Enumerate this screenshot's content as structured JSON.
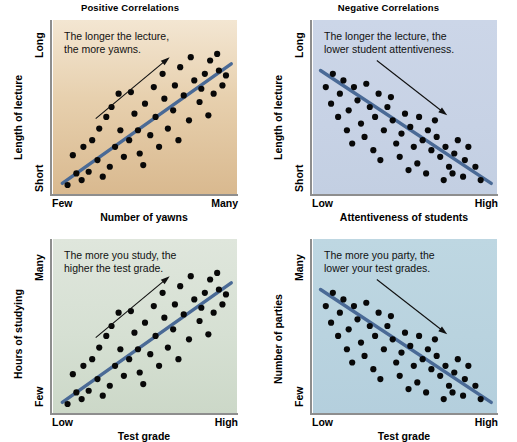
{
  "figure": {
    "width": 517,
    "height": 438,
    "background": "#ffffff"
  },
  "chart_data": [
    {
      "id": "positive-lecture-yawns",
      "type": "scatter",
      "title": "Positive Correlations",
      "caption": "The longer the lecture,\nthe more yawns.",
      "ylabel": "Length of lecture",
      "xlabel": "Number of yawns",
      "ytick_high": "Long",
      "ytick_low": "Short",
      "xtick_low": "Few",
      "xtick_high": "Many",
      "panel_color_top": "#f3e6d2",
      "panel_color_bottom": "#d9b98f",
      "trend_color": "#4a6a96",
      "correlation": "positive",
      "trendline": {
        "x1": 0.03,
        "y1": 0.04,
        "x2": 0.99,
        "y2": 0.76
      },
      "arrow": {
        "x1": 0.22,
        "y1": 0.43,
        "x2": 0.64,
        "y2": 0.8
      },
      "points": [
        [
          0.06,
          0.03
        ],
        [
          0.11,
          0.1
        ],
        [
          0.09,
          0.21
        ],
        [
          0.14,
          0.06
        ],
        [
          0.18,
          0.11
        ],
        [
          0.15,
          0.26
        ],
        [
          0.2,
          0.3
        ],
        [
          0.23,
          0.18
        ],
        [
          0.26,
          0.08
        ],
        [
          0.3,
          0.14
        ],
        [
          0.24,
          0.37
        ],
        [
          0.28,
          0.44
        ],
        [
          0.33,
          0.26
        ],
        [
          0.36,
          0.36
        ],
        [
          0.31,
          0.5
        ],
        [
          0.38,
          0.2
        ],
        [
          0.41,
          0.3
        ],
        [
          0.35,
          0.58
        ],
        [
          0.44,
          0.46
        ],
        [
          0.47,
          0.22
        ],
        [
          0.46,
          0.36
        ],
        [
          0.42,
          0.59
        ],
        [
          0.5,
          0.52
        ],
        [
          0.53,
          0.33
        ],
        [
          0.49,
          0.15
        ],
        [
          0.56,
          0.44
        ],
        [
          0.58,
          0.26
        ],
        [
          0.55,
          0.62
        ],
        [
          0.61,
          0.55
        ],
        [
          0.63,
          0.37
        ],
        [
          0.6,
          0.7
        ],
        [
          0.66,
          0.48
        ],
        [
          0.69,
          0.3
        ],
        [
          0.67,
          0.63
        ],
        [
          0.72,
          0.57
        ],
        [
          0.7,
          0.74
        ],
        [
          0.75,
          0.42
        ],
        [
          0.78,
          0.66
        ],
        [
          0.76,
          0.8
        ],
        [
          0.81,
          0.53
        ],
        [
          0.84,
          0.7
        ],
        [
          0.82,
          0.61
        ],
        [
          0.87,
          0.78
        ],
        [
          0.89,
          0.58
        ],
        [
          0.86,
          0.45
        ],
        [
          0.92,
          0.72
        ],
        [
          0.94,
          0.63
        ],
        [
          0.91,
          0.82
        ],
        [
          0.96,
          0.69
        ]
      ]
    },
    {
      "id": "negative-lecture-attentiveness",
      "type": "scatter",
      "title": "Negative Correlations",
      "caption": "The longer the lecture, the\nlower student attentiveness.",
      "ylabel": "Length of lecture",
      "xlabel": "Attentiveness of students",
      "ytick_high": "Long",
      "ytick_low": "Short",
      "xtick_low": "Low",
      "xtick_high": "High",
      "panel_color_top": "#ccd6e8",
      "panel_color_bottom": "#c3cfe2",
      "trend_color": "#4a6a96",
      "correlation": "negative",
      "trendline": {
        "x1": 0.02,
        "y1": 0.72,
        "x2": 0.99,
        "y2": 0.04
      },
      "arrow": {
        "x1": 0.34,
        "y1": 0.78,
        "x2": 0.74,
        "y2": 0.45
      },
      "points": [
        [
          0.05,
          0.62
        ],
        [
          0.09,
          0.7
        ],
        [
          0.08,
          0.52
        ],
        [
          0.13,
          0.58
        ],
        [
          0.15,
          0.66
        ],
        [
          0.12,
          0.44
        ],
        [
          0.18,
          0.48
        ],
        [
          0.21,
          0.62
        ],
        [
          0.17,
          0.36
        ],
        [
          0.23,
          0.54
        ],
        [
          0.25,
          0.4
        ],
        [
          0.2,
          0.28
        ],
        [
          0.28,
          0.64
        ],
        [
          0.3,
          0.5
        ],
        [
          0.27,
          0.32
        ],
        [
          0.33,
          0.44
        ],
        [
          0.35,
          0.58
        ],
        [
          0.32,
          0.24
        ],
        [
          0.38,
          0.36
        ],
        [
          0.4,
          0.5
        ],
        [
          0.36,
          0.18
        ],
        [
          0.43,
          0.42
        ],
        [
          0.45,
          0.28
        ],
        [
          0.42,
          0.56
        ],
        [
          0.48,
          0.34
        ],
        [
          0.5,
          0.46
        ],
        [
          0.47,
          0.2
        ],
        [
          0.53,
          0.38
        ],
        [
          0.55,
          0.26
        ],
        [
          0.52,
          0.12
        ],
        [
          0.58,
          0.44
        ],
        [
          0.6,
          0.3
        ],
        [
          0.57,
          0.16
        ],
        [
          0.63,
          0.36
        ],
        [
          0.65,
          0.24
        ],
        [
          0.62,
          0.1
        ],
        [
          0.68,
          0.32
        ],
        [
          0.7,
          0.2
        ],
        [
          0.67,
          0.42
        ],
        [
          0.73,
          0.26
        ],
        [
          0.75,
          0.14
        ],
        [
          0.72,
          0.06
        ],
        [
          0.78,
          0.22
        ],
        [
          0.8,
          0.3
        ],
        [
          0.77,
          0.1
        ],
        [
          0.84,
          0.18
        ],
        [
          0.86,
          0.26
        ],
        [
          0.83,
          0.08
        ],
        [
          0.9,
          0.14
        ],
        [
          0.93,
          0.06
        ]
      ]
    },
    {
      "id": "positive-study-grade",
      "type": "scatter",
      "title": "",
      "caption": "The more you study, the\nhigher the test grade.",
      "ylabel": "Hours of studying",
      "xlabel": "Test grade",
      "ytick_high": "Many",
      "ytick_low": "Few",
      "xtick_low": "Low",
      "xtick_high": "High",
      "panel_color_top": "#dfe6dc",
      "panel_color_bottom": "#ccd8c8",
      "trend_color": "#4a6a96",
      "correlation": "positive",
      "trendline": {
        "x1": 0.03,
        "y1": 0.04,
        "x2": 0.99,
        "y2": 0.76
      },
      "arrow": {
        "x1": 0.22,
        "y1": 0.43,
        "x2": 0.64,
        "y2": 0.8
      },
      "points": [
        [
          0.06,
          0.03
        ],
        [
          0.11,
          0.1
        ],
        [
          0.09,
          0.21
        ],
        [
          0.14,
          0.06
        ],
        [
          0.18,
          0.11
        ],
        [
          0.15,
          0.26
        ],
        [
          0.2,
          0.3
        ],
        [
          0.23,
          0.18
        ],
        [
          0.26,
          0.08
        ],
        [
          0.3,
          0.14
        ],
        [
          0.24,
          0.37
        ],
        [
          0.28,
          0.44
        ],
        [
          0.33,
          0.26
        ],
        [
          0.36,
          0.36
        ],
        [
          0.31,
          0.5
        ],
        [
          0.38,
          0.2
        ],
        [
          0.41,
          0.3
        ],
        [
          0.35,
          0.58
        ],
        [
          0.44,
          0.46
        ],
        [
          0.47,
          0.22
        ],
        [
          0.46,
          0.36
        ],
        [
          0.42,
          0.59
        ],
        [
          0.5,
          0.52
        ],
        [
          0.53,
          0.33
        ],
        [
          0.49,
          0.15
        ],
        [
          0.56,
          0.44
        ],
        [
          0.58,
          0.26
        ],
        [
          0.55,
          0.62
        ],
        [
          0.61,
          0.55
        ],
        [
          0.63,
          0.37
        ],
        [
          0.6,
          0.7
        ],
        [
          0.66,
          0.48
        ],
        [
          0.69,
          0.3
        ],
        [
          0.67,
          0.63
        ],
        [
          0.72,
          0.57
        ],
        [
          0.7,
          0.74
        ],
        [
          0.75,
          0.42
        ],
        [
          0.78,
          0.66
        ],
        [
          0.76,
          0.8
        ],
        [
          0.81,
          0.53
        ],
        [
          0.84,
          0.7
        ],
        [
          0.82,
          0.61
        ],
        [
          0.87,
          0.78
        ],
        [
          0.89,
          0.58
        ],
        [
          0.86,
          0.45
        ],
        [
          0.92,
          0.72
        ],
        [
          0.94,
          0.63
        ],
        [
          0.91,
          0.82
        ],
        [
          0.96,
          0.69
        ]
      ]
    },
    {
      "id": "negative-parties-grade",
      "type": "scatter",
      "title": "",
      "caption": "The more you party, the\nlower your test grades.",
      "ylabel": "Number of parties",
      "xlabel": "Test grade",
      "ytick_high": "Many",
      "ytick_low": "Few",
      "xtick_low": "Low",
      "xtick_high": "High",
      "panel_color_top": "#bed7e2",
      "panel_color_bottom": "#b4cfdd",
      "trend_color": "#4a6a96",
      "correlation": "negative",
      "trendline": {
        "x1": 0.02,
        "y1": 0.72,
        "x2": 0.99,
        "y2": 0.04
      },
      "arrow": {
        "x1": 0.34,
        "y1": 0.78,
        "x2": 0.74,
        "y2": 0.45
      },
      "points": [
        [
          0.05,
          0.62
        ],
        [
          0.09,
          0.7
        ],
        [
          0.08,
          0.52
        ],
        [
          0.13,
          0.58
        ],
        [
          0.15,
          0.66
        ],
        [
          0.12,
          0.44
        ],
        [
          0.18,
          0.48
        ],
        [
          0.21,
          0.62
        ],
        [
          0.17,
          0.36
        ],
        [
          0.23,
          0.54
        ],
        [
          0.25,
          0.4
        ],
        [
          0.2,
          0.28
        ],
        [
          0.28,
          0.64
        ],
        [
          0.3,
          0.5
        ],
        [
          0.27,
          0.32
        ],
        [
          0.33,
          0.44
        ],
        [
          0.35,
          0.58
        ],
        [
          0.32,
          0.24
        ],
        [
          0.38,
          0.36
        ],
        [
          0.4,
          0.5
        ],
        [
          0.36,
          0.18
        ],
        [
          0.43,
          0.42
        ],
        [
          0.45,
          0.28
        ],
        [
          0.42,
          0.56
        ],
        [
          0.48,
          0.34
        ],
        [
          0.5,
          0.46
        ],
        [
          0.47,
          0.2
        ],
        [
          0.53,
          0.38
        ],
        [
          0.55,
          0.26
        ],
        [
          0.52,
          0.12
        ],
        [
          0.58,
          0.44
        ],
        [
          0.6,
          0.3
        ],
        [
          0.57,
          0.16
        ],
        [
          0.63,
          0.36
        ],
        [
          0.65,
          0.24
        ],
        [
          0.62,
          0.1
        ],
        [
          0.68,
          0.32
        ],
        [
          0.7,
          0.2
        ],
        [
          0.67,
          0.42
        ],
        [
          0.73,
          0.26
        ],
        [
          0.75,
          0.14
        ],
        [
          0.72,
          0.06
        ],
        [
          0.78,
          0.22
        ],
        [
          0.8,
          0.3
        ],
        [
          0.77,
          0.1
        ],
        [
          0.84,
          0.18
        ],
        [
          0.86,
          0.26
        ],
        [
          0.83,
          0.08
        ],
        [
          0.9,
          0.14
        ],
        [
          0.93,
          0.06
        ]
      ]
    }
  ]
}
